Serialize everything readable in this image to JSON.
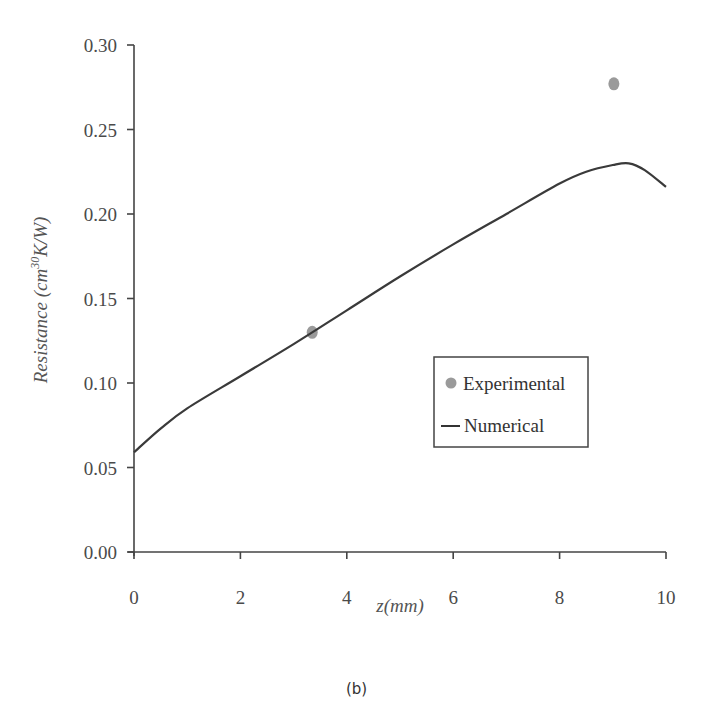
{
  "chart_data": {
    "type": "line",
    "title": "",
    "caption": "(b)",
    "xlabel": "z(mm)",
    "ylabel": "Resistance (cm³⁰K/W)",
    "xlim": [
      0,
      10
    ],
    "ylim": [
      0.0,
      0.3
    ],
    "xticks": [
      "0",
      "2",
      "4",
      "6",
      "8",
      "10"
    ],
    "yticks": [
      "0.00",
      "0.05",
      "0.10",
      "0.15",
      "0.20",
      "0.25",
      "0.30"
    ],
    "grid": false,
    "legend_position": "center-right",
    "series": [
      {
        "name": "Experimental",
        "kind": "scatter",
        "color": "#9a9a9a",
        "points": [
          {
            "x": 3.35,
            "y": 0.13
          },
          {
            "x": 9.02,
            "y": 0.277
          }
        ]
      },
      {
        "name": "Numerical",
        "kind": "line",
        "color": "#3a3a3a",
        "points": [
          {
            "x": 0.0,
            "y": 0.059
          },
          {
            "x": 0.5,
            "y": 0.073
          },
          {
            "x": 1.0,
            "y": 0.085
          },
          {
            "x": 2.0,
            "y": 0.104
          },
          {
            "x": 3.0,
            "y": 0.123
          },
          {
            "x": 4.0,
            "y": 0.143
          },
          {
            "x": 5.0,
            "y": 0.163
          },
          {
            "x": 6.0,
            "y": 0.182
          },
          {
            "x": 7.0,
            "y": 0.2
          },
          {
            "x": 8.0,
            "y": 0.218
          },
          {
            "x": 8.5,
            "y": 0.225
          },
          {
            "x": 9.0,
            "y": 0.229
          },
          {
            "x": 9.3,
            "y": 0.23
          },
          {
            "x": 9.6,
            "y": 0.226
          },
          {
            "x": 10.0,
            "y": 0.216
          }
        ]
      }
    ]
  },
  "legend": {
    "items": [
      {
        "label": "Experimental",
        "symbol": "dot"
      },
      {
        "label": "Numerical",
        "symbol": "line"
      }
    ]
  },
  "caption": "(b)"
}
